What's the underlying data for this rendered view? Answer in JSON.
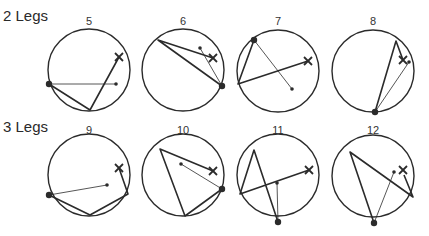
{
  "rows": [
    {
      "label": "2 Legs"
    },
    {
      "label": "3 Legs"
    }
  ],
  "diagrams": [
    {
      "number": "5",
      "cx": 89,
      "cy": 70,
      "r": 41,
      "big_dot": [
        49,
        84
      ],
      "small_dot": [
        116,
        84
      ],
      "x_mark": [
        119,
        57
      ],
      "thick_path": [
        [
          49,
          84
        ],
        [
          90,
          110
        ],
        [
          119,
          57
        ]
      ],
      "thin_lines": [
        [
          [
            49,
            84
          ],
          [
            116,
            84
          ]
        ]
      ]
    },
    {
      "number": "6",
      "cx": 183,
      "cy": 70,
      "r": 41,
      "big_dot": [
        222,
        86
      ],
      "small_dot": [
        200,
        48
      ],
      "x_mark": [
        213,
        58
      ],
      "thick_path": [
        [
          222,
          86
        ],
        [
          158,
          40
        ],
        [
          213,
          58
        ]
      ],
      "thin_lines": [
        [
          [
            200,
            48
          ],
          [
            222,
            86
          ]
        ]
      ]
    },
    {
      "number": "7",
      "cx": 278,
      "cy": 71,
      "r": 41,
      "big_dot": [
        254,
        40
      ],
      "small_dot": [
        292,
        89
      ],
      "x_mark": [
        308,
        61
      ],
      "thick_path": [
        [
          254,
          40
        ],
        [
          238,
          84
        ],
        [
          308,
          61
        ]
      ],
      "thin_lines": [
        [
          [
            254,
            40
          ],
          [
            292,
            89
          ]
        ]
      ]
    },
    {
      "number": "8",
      "cx": 373,
      "cy": 71,
      "r": 41,
      "big_dot": [
        375,
        112
      ],
      "small_dot": [
        409,
        62
      ],
      "x_mark": [
        403,
        60
      ],
      "thick_path": [
        [
          375,
          112
        ],
        [
          396,
          41
        ],
        [
          403,
          60
        ]
      ],
      "thin_lines": [
        [
          [
            375,
            112
          ],
          [
            409,
            62
          ]
        ]
      ]
    },
    {
      "number": "9",
      "cx": 89,
      "cy": 175,
      "r": 41,
      "big_dot": [
        49,
        195
      ],
      "small_dot": [
        107,
        185
      ],
      "x_mark": [
        119,
        168
      ],
      "thick_path": [
        [
          49,
          195
        ],
        [
          90,
          215
        ],
        [
          128,
          194
        ],
        [
          119,
          168
        ]
      ],
      "thin_lines": [
        [
          [
            49,
            195
          ],
          [
            107,
            185
          ]
        ]
      ]
    },
    {
      "number": "10",
      "cx": 183,
      "cy": 175,
      "r": 41,
      "big_dot": [
        222,
        189
      ],
      "small_dot": [
        181,
        164
      ],
      "x_mark": [
        213,
        171
      ],
      "thick_path": [
        [
          222,
          189
        ],
        [
          185,
          216
        ],
        [
          160,
          149
        ],
        [
          213,
          171
        ]
      ],
      "thin_lines": [
        [
          [
            181,
            164
          ],
          [
            222,
            189
          ]
        ]
      ]
    },
    {
      "number": "11",
      "cx": 278,
      "cy": 175,
      "r": 41,
      "big_dot": [
        278,
        222
      ],
      "small_dot": [
        277,
        183
      ],
      "x_mark": [
        309,
        170
      ],
      "thick_path": [
        [
          278,
          222
        ],
        [
          254,
          150
        ],
        [
          240,
          194
        ],
        [
          309,
          170
        ]
      ],
      "thin_lines": [
        [
          [
            277,
            183
          ],
          [
            278,
            222
          ]
        ]
      ]
    },
    {
      "number": "12",
      "cx": 373,
      "cy": 176,
      "r": 41,
      "big_dot": [
        374,
        223
      ],
      "small_dot": [
        394,
        172
      ],
      "x_mark": [
        403,
        170
      ],
      "thick_path": [
        [
          374,
          223
        ],
        [
          350,
          152
        ],
        [
          413,
          197
        ],
        [
          404,
          175
        ]
      ],
      "thin_lines": [
        [
          [
            374,
            223
          ],
          [
            394,
            172
          ]
        ]
      ]
    }
  ],
  "colors": {
    "stroke": "#2b2b2b",
    "background": "#ffffff"
  }
}
